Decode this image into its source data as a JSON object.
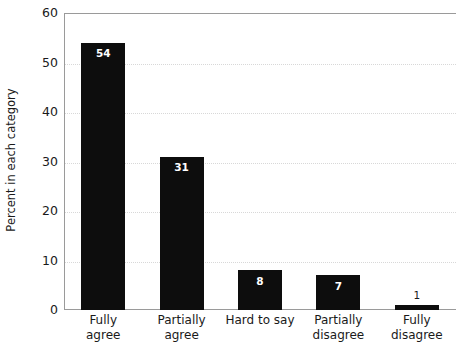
{
  "chart_data": {
    "type": "bar",
    "title": "",
    "xlabel": "",
    "ylabel": "Percent in each category",
    "categories": [
      "Fully agree",
      "Partially agree",
      "Hard to say",
      "Partially disagree",
      "Fully disagree"
    ],
    "category_lines": [
      [
        "Fully",
        "agree"
      ],
      [
        "Partially",
        "agree"
      ],
      [
        "Hard to say"
      ],
      [
        "Partially",
        "disagree"
      ],
      [
        "Fully",
        "disagree"
      ]
    ],
    "values": [
      54,
      31,
      8,
      7,
      1
    ],
    "value_labels": [
      "54",
      "31",
      "8",
      "7",
      "1"
    ],
    "label_inside": [
      true,
      true,
      true,
      true,
      false
    ],
    "ylim": [
      0,
      60
    ],
    "yticks": [
      0,
      10,
      20,
      30,
      40,
      50,
      60
    ],
    "ytick_labels": [
      "0",
      "10",
      "20",
      "30",
      "40",
      "50",
      "60"
    ],
    "grid": "horizontal-dotted",
    "legend": "none",
    "bar_color": "#0d0d0d",
    "background_color": "#ffffff",
    "gridline_color": "#d8d8d8",
    "axis_color": "#9a9a9a"
  }
}
